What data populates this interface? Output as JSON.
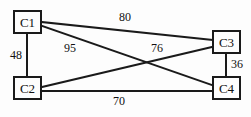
{
  "diagram": {
    "type": "undirected-weighted-graph",
    "background_color": "#fdfdfd",
    "line_color": "#1a1a1a",
    "text_color": "#111111",
    "nodes": [
      {
        "id": "C1",
        "label": "C1",
        "x": 13,
        "y": 10,
        "w": 29,
        "h": 24
      },
      {
        "id": "C3",
        "label": "C3",
        "x": 212,
        "y": 30,
        "w": 29,
        "h": 24
      },
      {
        "id": "C2",
        "label": "C2",
        "x": 13,
        "y": 76,
        "w": 29,
        "h": 24
      },
      {
        "id": "C4",
        "label": "C4",
        "x": 212,
        "y": 76,
        "w": 29,
        "h": 24
      }
    ],
    "edges": [
      {
        "id": "e-c1-c3",
        "from": "C1",
        "to": "C3",
        "weight": "80",
        "x1": 42,
        "y1": 22,
        "x2": 212,
        "y2": 40,
        "label_x": 118,
        "label_y": 11
      },
      {
        "id": "e-c1-c2",
        "from": "C1",
        "to": "C2",
        "weight": "48",
        "x1": 27,
        "y1": 34,
        "x2": 27,
        "y2": 76,
        "label_x": 9,
        "label_y": 49
      },
      {
        "id": "e-c1-c4",
        "from": "C1",
        "to": "C4",
        "weight": "95",
        "x1": 42,
        "y1": 26,
        "x2": 212,
        "y2": 85,
        "label_x": 63,
        "label_y": 42
      },
      {
        "id": "e-c2-c3",
        "from": "C2",
        "to": "C3",
        "weight": "76",
        "x1": 42,
        "y1": 87,
        "x2": 212,
        "y2": 47,
        "label_x": 150,
        "label_y": 42
      },
      {
        "id": "e-c2-c4",
        "from": "C2",
        "to": "C4",
        "weight": "70",
        "x1": 42,
        "y1": 91,
        "x2": 212,
        "y2": 91,
        "label_x": 112,
        "label_y": 95
      },
      {
        "id": "e-c3-c4",
        "from": "C3",
        "to": "C4",
        "weight": "36",
        "x1": 226,
        "y1": 54,
        "x2": 226,
        "y2": 76,
        "label_x": 230,
        "label_y": 58
      }
    ]
  }
}
